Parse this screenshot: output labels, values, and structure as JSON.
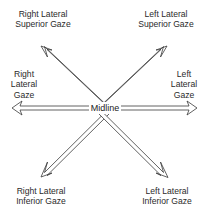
{
  "diagram": {
    "center_label": "Midline",
    "stroke_color": "#3a3a3a",
    "background": "#ffffff",
    "directions": [
      {
        "id": "right-lateral-superior",
        "lines": [
          "Right Lateral",
          "Superior Gaze"
        ]
      },
      {
        "id": "left-lateral-superior",
        "lines": [
          "Left Lateral",
          "Superior Gaze"
        ]
      },
      {
        "id": "right-lateral",
        "lines": [
          "Right",
          "Lateral",
          "Gaze"
        ]
      },
      {
        "id": "left-lateral",
        "lines": [
          "Left",
          "Lateral",
          "Gaze"
        ]
      },
      {
        "id": "right-lateral-inferior",
        "lines": [
          "Right Lateral",
          "Inferior Gaze"
        ]
      },
      {
        "id": "left-lateral-inferior",
        "lines": [
          "Left Lateral",
          "Inferior Gaze"
        ]
      }
    ]
  }
}
